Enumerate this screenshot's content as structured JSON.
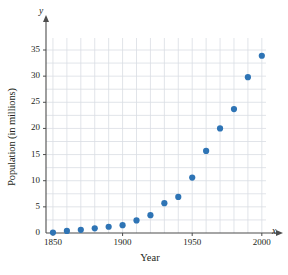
{
  "chart_data": {
    "type": "scatter",
    "title": "",
    "xlabel": "Year",
    "ylabel": "Population (in millions)",
    "x": [
      1850,
      1860,
      1870,
      1880,
      1890,
      1900,
      1910,
      1920,
      1930,
      1940,
      1950,
      1960,
      1970,
      1980,
      1990,
      2000
    ],
    "values": [
      0.1,
      0.4,
      0.6,
      0.9,
      1.2,
      1.5,
      2.4,
      3.4,
      5.7,
      6.9,
      10.6,
      15.7,
      20.0,
      23.7,
      29.8,
      33.9
    ],
    "xlim": [
      1845,
      2003
    ],
    "ylim": [
      0,
      36.5
    ],
    "xticks": [
      1850,
      1900,
      1950,
      2000
    ],
    "xtick_labels": [
      "1850",
      "1900",
      "1950",
      "2000"
    ],
    "yticks": [
      0,
      5,
      10,
      15,
      20,
      25,
      30,
      35
    ],
    "ytick_labels": [
      "0",
      "5",
      "10",
      "15",
      "20",
      "25",
      "30",
      "35"
    ],
    "grid": true,
    "grid_x_step": 10,
    "grid_y_step": 2.5,
    "legend": "none",
    "axis_letters": {
      "x": "x",
      "y": "y"
    },
    "marker_color": "#2e74b5",
    "grid_color": "#d9dde3",
    "axis_color": "#4d4d4d",
    "text_color": "#231f20"
  }
}
